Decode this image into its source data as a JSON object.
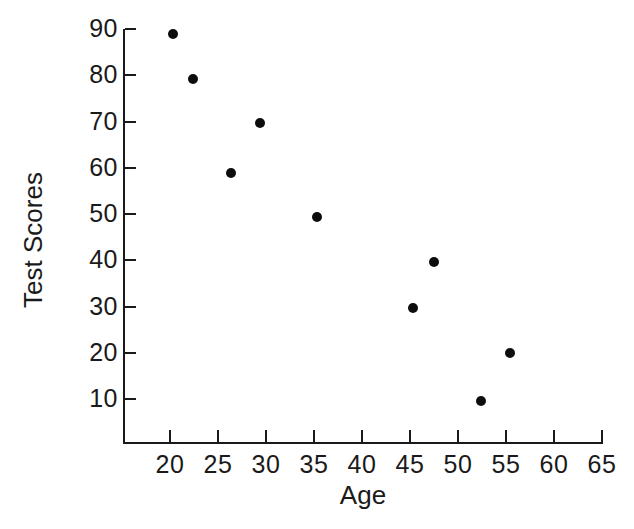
{
  "chart_data": {
    "type": "scatter",
    "title": "",
    "xlabel": "Age",
    "ylabel": "Test Scores",
    "xlim": [
      16.5,
      65
    ],
    "ylim": [
      5,
      92
    ],
    "grid": false,
    "legend": "none",
    "xticks": [
      20,
      25,
      30,
      35,
      40,
      45,
      50,
      55,
      60,
      65
    ],
    "yticks": [
      10,
      20,
      30,
      40,
      50,
      60,
      70,
      80,
      90
    ],
    "xtick_labels": [
      "20",
      "25",
      "30",
      "35",
      "40",
      "45",
      "50",
      "55",
      "60",
      "65"
    ],
    "ytick_labels": [
      "10",
      "20",
      "30",
      "40",
      "50",
      "60",
      "70",
      "80",
      "90"
    ],
    "series": [
      {
        "name": "Test Scores vs Age",
        "marker": "filled-circle",
        "color": "#0d0d0d",
        "x": [
          20.3,
          22.4,
          26.4,
          29.4,
          35.3,
          45.3,
          47.5,
          52.4,
          55.4
        ],
        "y": [
          88.9,
          79.1,
          58.9,
          69.6,
          49.4,
          29.7,
          39.6,
          9.6,
          19.9
        ]
      }
    ]
  },
  "axes": {
    "x_title": "Age",
    "y_title": "Test Scores"
  },
  "colors": {
    "ink": "#1a1a1a",
    "marker": "#0d0d0d",
    "background": "#ffffff"
  }
}
